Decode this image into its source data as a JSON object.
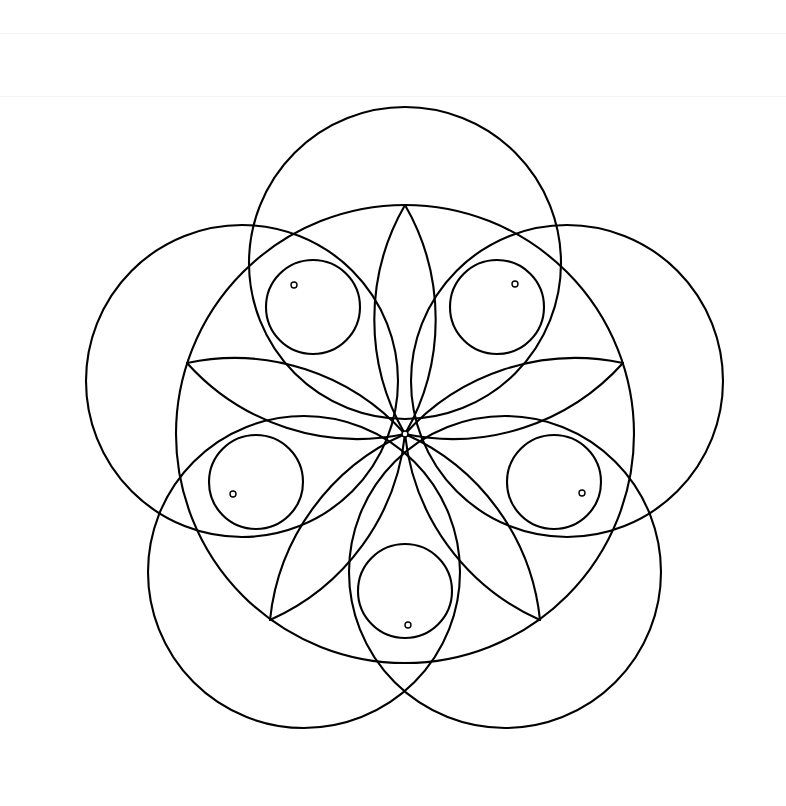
{
  "figure": {
    "type": "geometric-line-drawing",
    "canvas": {
      "width": 786,
      "height": 806,
      "background": "#ffffff"
    },
    "stroke": {
      "color": "#000000",
      "width": 2.1,
      "fill": "none",
      "linecap": "round"
    },
    "symmetry": {
      "order": 5,
      "rotation_step_degrees": 72,
      "phase_degrees": -90
    },
    "center": {
      "x": 405,
      "y": 434
    },
    "main_circle": {
      "label": "central circle",
      "cx": 405,
      "cy": 434,
      "r": 229
    },
    "petal_circles": {
      "label": "outer petal circles",
      "count": 5,
      "r": 156,
      "center_orbit_radius": 171,
      "centers": [
        {
          "index": 0,
          "angle_degrees": -90,
          "cx": 405,
          "cy": 263
        },
        {
          "index": 1,
          "angle_degrees": -18,
          "cx": 567,
          "cy": 381
        },
        {
          "index": 2,
          "angle_degrees": 54,
          "cx": 505,
          "cy": 572
        },
        {
          "index": 3,
          "angle_degrees": 126,
          "cx": 304,
          "cy": 572
        },
        {
          "index": 4,
          "angle_degrees": 198,
          "cx": 242,
          "cy": 381
        }
      ]
    },
    "small_circles": {
      "label": "small node circles",
      "count": 5,
      "r": 47,
      "center_orbit_radius": 157,
      "centers": [
        {
          "index": 0,
          "angle_degrees": -54,
          "cx": 497,
          "cy": 307
        },
        {
          "index": 1,
          "angle_degrees": 18,
          "cx": 554,
          "cy": 482
        },
        {
          "index": 2,
          "angle_degrees": 90,
          "cx": 405,
          "cy": 591
        },
        {
          "index": 3,
          "angle_degrees": 162,
          "cx": 256,
          "cy": 482
        },
        {
          "index": 4,
          "angle_degrees": 234,
          "cx": 313,
          "cy": 307
        }
      ]
    },
    "node_dots": {
      "label": "marked intersection nodes",
      "r": 3.0,
      "fill": "#ffffff",
      "points": [
        {
          "name": "node-upper-left",
          "x": 294,
          "y": 285
        },
        {
          "name": "node-upper-right",
          "x": 515,
          "y": 284
        },
        {
          "name": "node-left",
          "x": 233,
          "y": 494
        },
        {
          "name": "node-right",
          "x": 582,
          "y": 493
        },
        {
          "name": "node-bottom",
          "x": 408,
          "y": 625
        },
        {
          "name": "node-center",
          "x": 405,
          "y": 434
        }
      ]
    },
    "inner_arcs": {
      "label": "inner star arcs converging at center",
      "count": 10,
      "arc_radius": 229,
      "description": "arcs of radius equal to the main circle drawn from each vertex through the center"
    },
    "vertices": {
      "label": "pentagon vertices on main circle",
      "count": 5,
      "points": [
        {
          "name": "vertex-top",
          "x": 405,
          "y": 205
        },
        {
          "name": "vertex-right",
          "x": 623,
          "y": 363
        },
        {
          "name": "vertex-lower-right",
          "x": 540,
          "y": 620
        },
        {
          "name": "vertex-lower-left",
          "x": 270,
          "y": 620
        },
        {
          "name": "vertex-left",
          "x": 187,
          "y": 363
        }
      ]
    },
    "scanlines": [
      {
        "name": "scan-artifact-top",
        "y": 33
      },
      {
        "name": "scan-artifact-upper",
        "y": 96
      }
    ]
  }
}
